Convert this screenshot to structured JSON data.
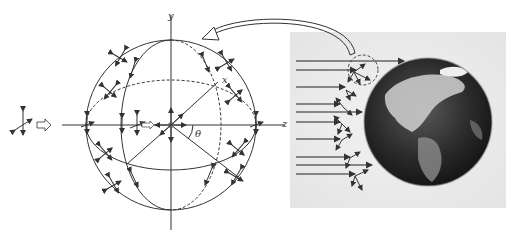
{
  "figure": {
    "left_panel": {
      "axis_labels": {
        "y": "y",
        "x": "x",
        "z": "z",
        "angle": "θ"
      },
      "incident_polarization_arrow": "⇨",
      "curved_arrow_direction": "from right panel (dashed circle) to sphere"
    },
    "right_panel": {
      "subject": "Earth",
      "num_incoming_rays": 11,
      "highlight": "dashed circle around scattering region"
    },
    "colors": {
      "line": "#333333",
      "background": "#ffffff",
      "photo_background": "#eeeeee",
      "earth_dark": "#1e1e1e",
      "earth_land": "#cfcfcf"
    }
  }
}
